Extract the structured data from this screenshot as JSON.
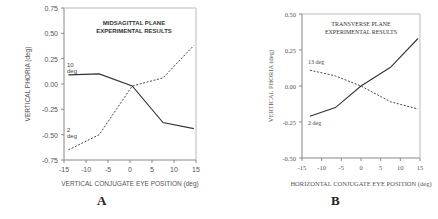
{
  "chart_data": [
    {
      "panel": "A",
      "type": "line",
      "title": "MIDSAGITTAL PLANE EXPERIMENTAL RESULTS",
      "title_lines": [
        "MIDSAGITTAL PLANE",
        "EXPERIMENTAL RESULTS"
      ],
      "xlabel": "VERTICAL CONJUGATE EYE POSITION (deg)",
      "ylabel": "VERTICAL PHORIA (deg)",
      "xlim": [
        -15,
        15
      ],
      "ylim": [
        -0.75,
        0.75
      ],
      "xticks": [
        "-15",
        "-10",
        "-5",
        "0",
        "5",
        "10",
        "15"
      ],
      "yticks": [
        "0.75",
        "0.50",
        "0.25",
        "0.00",
        "-0.25",
        "-0.50",
        "-0.75"
      ],
      "grid": false,
      "x": [
        -14,
        -7,
        0.5,
        7.5,
        14.5
      ],
      "series": [
        {
          "name": "10 deg",
          "label_lines": [
            "10",
            "deg"
          ],
          "style": "solid",
          "values": [
            0.09,
            0.1,
            -0.02,
            -0.38,
            -0.44
          ]
        },
        {
          "name": "2 deg",
          "label_lines": [
            "2",
            "deg"
          ],
          "style": "dashed",
          "values": [
            -0.65,
            -0.5,
            -0.02,
            0.06,
            0.38
          ]
        }
      ]
    },
    {
      "panel": "B",
      "type": "line",
      "title": "TRANSVERSE PLANE EXPERIMENTAL RESULTS",
      "title_lines": [
        "TRANSVERSE PLANE",
        "EXPERIMENTAL RESULTS"
      ],
      "xlabel": "HORIZONTAL CONJUGATE EYE POSITION (deg)",
      "ylabel": "VERTICAL PHORIA (deg)",
      "xlim": [
        -15,
        15
      ],
      "ylim": [
        -0.5,
        0.5
      ],
      "xticks": [
        "-15",
        "-10",
        "-5",
        "0",
        "5",
        "10",
        "15"
      ],
      "yticks": [
        "0.50",
        "0.25",
        "0.00",
        "-0.25",
        "-0.50"
      ],
      "grid": false,
      "x": [
        -13,
        -6.5,
        0,
        7.5,
        14.5
      ],
      "series": [
        {
          "name": "13 deg",
          "label_lines": [
            "13 deg"
          ],
          "style": "solid",
          "values": [
            -0.21,
            -0.15,
            0.0,
            0.13,
            0.33
          ]
        },
        {
          "name": "2 deg",
          "label_lines": [
            "2 deg"
          ],
          "style": "dashed",
          "values": [
            0.11,
            0.07,
            0.0,
            -0.11,
            -0.16
          ]
        }
      ]
    }
  ],
  "panels": {
    "A": {
      "letter": "A"
    },
    "B": {
      "letter": "B"
    }
  }
}
